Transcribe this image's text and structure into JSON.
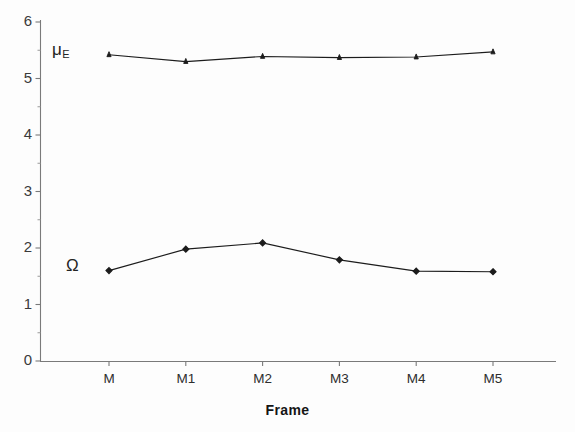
{
  "chart_data": {
    "type": "line",
    "title": "",
    "subtitle": "",
    "xlabel": "Frame",
    "ylabel": "",
    "categories": [
      "M",
      "M1",
      "M2",
      "M3",
      "M4",
      "M5"
    ],
    "series": [
      {
        "name": "mu_E",
        "display_label": "μ",
        "display_subscript": "E",
        "values": [
          5.42,
          5.3,
          5.39,
          5.37,
          5.38,
          5.47
        ],
        "marker": "filled-triangle",
        "color": "#1c1c1c",
        "label_position": {
          "x": 52,
          "y": 40
        }
      },
      {
        "name": "Omega",
        "display_label": "Ω",
        "display_subscript": "",
        "values": [
          1.6,
          1.98,
          2.09,
          1.79,
          1.59,
          1.58
        ],
        "marker": "filled-diamond",
        "color": "#1c1c1c",
        "label_position": {
          "x": 66,
          "y": 256
        }
      }
    ],
    "ylim": [
      0,
      6
    ],
    "y_ticks": [
      0,
      1,
      2,
      3,
      4,
      5,
      6
    ],
    "y_minor_ticks": [
      0.5,
      1.5,
      2.5,
      3.5,
      4.5,
      5.5
    ],
    "grid": false,
    "legend": "inline-series-labels",
    "legend_position": "inside-left"
  },
  "axes": {
    "y_tick_labels": [
      "6",
      "5",
      "4",
      "3",
      "2",
      "1",
      "0"
    ],
    "x_tick_labels": [
      "M",
      "M1",
      "M2",
      "M3",
      "M4",
      "M5"
    ],
    "x_axis_title": "Frame"
  },
  "style": {
    "background": "#fdfdfd",
    "ink": "#1c1c1c",
    "axis_color": "#6e6e6e",
    "tick_label_color": "#3a3a3a"
  }
}
